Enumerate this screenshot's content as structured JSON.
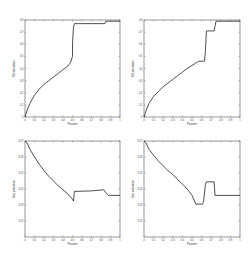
{
  "chart_data": [
    {
      "type": "line",
      "panel": "top-left",
      "title": "",
      "xlabel": "Position",
      "ylabel": "Oil saturation",
      "xlim": [
        0,
        1
      ],
      "ylim": [
        0,
        0.8
      ],
      "xticks": [
        "0",
        "0.1",
        "0.2",
        "0.3",
        "0.4",
        "0.5",
        "0.6",
        "0.7",
        "0.8",
        "0.9",
        "1"
      ],
      "yticks": [
        "0",
        "0.1",
        "0.2",
        "0.3",
        "0.4",
        "0.5",
        "0.6",
        "0.7",
        "0.8"
      ],
      "x": [
        0,
        0.02,
        0.05,
        0.1,
        0.15,
        0.2,
        0.25,
        0.3,
        0.35,
        0.4,
        0.45,
        0.48,
        0.5,
        0.5,
        0.51,
        0.52,
        0.6,
        0.7,
        0.8,
        0.84,
        0.85,
        0.9,
        1.0
      ],
      "y": [
        0,
        0.05,
        0.11,
        0.18,
        0.23,
        0.27,
        0.3,
        0.33,
        0.36,
        0.39,
        0.42,
        0.45,
        0.5,
        0.6,
        0.74,
        0.77,
        0.77,
        0.77,
        0.77,
        0.77,
        0.79,
        0.79,
        0.79
      ]
    },
    {
      "type": "line",
      "panel": "top-right",
      "title": "",
      "xlabel": "Position",
      "ylabel": "Oil saturation",
      "xlim": [
        0,
        1
      ],
      "ylim": [
        0,
        0.8
      ],
      "xticks": [
        "0",
        "0.1",
        "0.2",
        "0.3",
        "0.4",
        "0.5",
        "0.6",
        "0.7",
        "0.8",
        "0.9",
        "1"
      ],
      "yticks": [
        "0",
        "0.1",
        "0.2",
        "0.3",
        "0.4",
        "0.5",
        "0.6",
        "0.7",
        "0.8"
      ],
      "x": [
        0,
        0.02,
        0.05,
        0.1,
        0.15,
        0.2,
        0.25,
        0.3,
        0.35,
        0.4,
        0.45,
        0.55,
        0.57,
        0.63,
        0.64,
        0.65,
        0.73,
        0.74,
        0.75,
        1.0
      ],
      "y": [
        0,
        0.05,
        0.11,
        0.17,
        0.21,
        0.25,
        0.28,
        0.31,
        0.34,
        0.37,
        0.4,
        0.45,
        0.46,
        0.46,
        0.55,
        0.71,
        0.71,
        0.75,
        0.79,
        0.79
      ]
    },
    {
      "type": "line",
      "panel": "bottom-left",
      "title": "",
      "xlabel": "Position",
      "ylabel": "Gas saturation",
      "xlim": [
        0,
        1
      ],
      "ylim": [
        0.21,
        0.27
      ],
      "xticks": [
        "0",
        "0.1",
        "0.2",
        "0.3",
        "0.4",
        "0.5",
        "0.6",
        "0.7",
        "0.8",
        "0.9",
        "1"
      ],
      "yticks": [
        "0.22",
        "0.23",
        "0.24",
        "0.25",
        "0.26",
        "0.27"
      ],
      "x": [
        0,
        0.02,
        0.05,
        0.1,
        0.15,
        0.2,
        0.25,
        0.3,
        0.35,
        0.4,
        0.45,
        0.5,
        0.51,
        0.52,
        0.7,
        0.83,
        0.86,
        0.88,
        0.9,
        1.0
      ],
      "y": [
        0.27,
        0.269,
        0.265,
        0.26,
        0.2555,
        0.2515,
        0.248,
        0.245,
        0.242,
        0.2395,
        0.237,
        0.2335,
        0.2325,
        0.2385,
        0.2388,
        0.2395,
        0.237,
        0.236,
        0.236,
        0.236
      ]
    },
    {
      "type": "line",
      "panel": "bottom-right",
      "title": "",
      "xlabel": "Position",
      "ylabel": "Gas saturation",
      "xlim": [
        0,
        1
      ],
      "ylim": [
        0.21,
        0.27
      ],
      "xticks": [
        "0",
        "0.1",
        "0.2",
        "0.3",
        "0.4",
        "0.5",
        "0.6",
        "0.7",
        "0.8",
        "0.9",
        "1"
      ],
      "yticks": [
        "0.22",
        "0.23",
        "0.24",
        "0.25",
        "0.26",
        "0.27"
      ],
      "x": [
        0,
        0.02,
        0.05,
        0.1,
        0.15,
        0.2,
        0.25,
        0.3,
        0.35,
        0.4,
        0.45,
        0.5,
        0.54,
        0.57,
        0.61,
        0.62,
        0.64,
        0.65,
        0.73,
        0.74,
        0.75,
        1.0
      ],
      "y": [
        0.27,
        0.269,
        0.265,
        0.261,
        0.2575,
        0.2545,
        0.2515,
        0.249,
        0.246,
        0.243,
        0.24,
        0.236,
        0.2305,
        0.2305,
        0.2305,
        0.232,
        0.243,
        0.2445,
        0.2445,
        0.236,
        0.236,
        0.236
      ]
    }
  ]
}
